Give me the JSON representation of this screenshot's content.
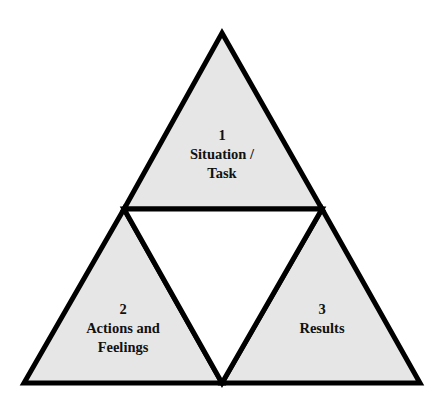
{
  "diagram": {
    "type": "triangle-segments",
    "fill_color": "#e6e6e6",
    "stroke_color": "#000000",
    "segments": [
      {
        "number": "1",
        "line1": "Situation /",
        "line2": "Task"
      },
      {
        "number": "2",
        "line1": "Actions and",
        "line2": "Feelings"
      },
      {
        "number": "3",
        "line1": "Results",
        "line2": ""
      }
    ]
  }
}
